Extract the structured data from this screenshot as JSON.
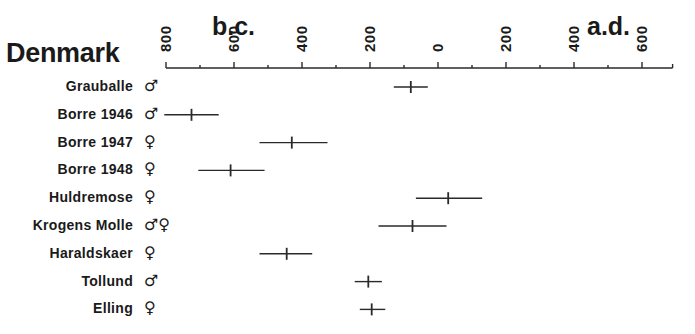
{
  "chart_data": {
    "type": "range-dot",
    "title": "Denmark",
    "era_labels": {
      "left": "b.c.",
      "right": "a.d."
    },
    "xlabel": "",
    "x_axis": {
      "tick_labels": [
        "800",
        "600",
        "400",
        "200",
        "0",
        "200",
        "400",
        "600"
      ],
      "tick_values": [
        -800,
        -600,
        -400,
        -200,
        0,
        200,
        400,
        600
      ],
      "minor_ticks_every": 100,
      "range": [
        -800,
        690
      ],
      "position": "top"
    },
    "grid": false,
    "legend": null,
    "series": [
      {
        "name": "Grauballe",
        "sex": "♂",
        "center": -80,
        "low": -130,
        "high": -30
      },
      {
        "name": "Borre 1946",
        "sex": "♂",
        "center": -725,
        "low": -805,
        "high": -645
      },
      {
        "name": "Borre 1947",
        "sex": "♀",
        "center": -430,
        "low": -525,
        "high": -325
      },
      {
        "name": "Borre 1948",
        "sex": "♀",
        "center": -610,
        "low": -705,
        "high": -510
      },
      {
        "name": "Huldremose",
        "sex": "♀",
        "center": 30,
        "low": -65,
        "high": 130
      },
      {
        "name": "Krogens Molle",
        "sex": "♂♀",
        "center": -75,
        "low": -175,
        "high": 25
      },
      {
        "name": "Haraldskaer",
        "sex": "♀",
        "center": -445,
        "low": -525,
        "high": -370
      },
      {
        "name": "Tollund",
        "sex": "♂",
        "center": -205,
        "low": -245,
        "high": -165
      },
      {
        "name": "Elling",
        "sex": "♀",
        "center": -195,
        "low": -230,
        "high": -155
      }
    ]
  },
  "labels": {
    "title": "Denmark",
    "bc": "b.c.",
    "ad": "a.d."
  }
}
